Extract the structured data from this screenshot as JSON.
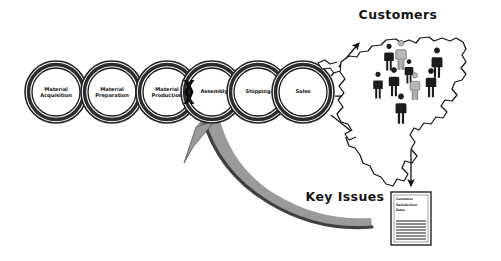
{
  "diagram": {
    "title_hidden": "",
    "type": "supply-chain-process-chain",
    "chain": {
      "rings": [
        {
          "id": "material-acquisition",
          "label": "Material\nAcquisition",
          "cx": 56,
          "cy": 92
        },
        {
          "id": "material-preparation",
          "label": "Material\nPreparation",
          "cx": 112,
          "cy": 92
        },
        {
          "id": "material-production",
          "label": "Material\nProduction",
          "cx": 167,
          "cy": 92
        },
        {
          "id": "assembly",
          "label": "Assembly",
          "cx": 212,
          "cy": 92
        },
        {
          "id": "shipping",
          "label": "Shipping",
          "cx": 258,
          "cy": 92
        },
        {
          "id": "sales",
          "label": "Sales",
          "cx": 303,
          "cy": 92
        }
      ],
      "break_marker": {
        "id": "chain-break-x",
        "x": 189,
        "y": 92,
        "meaning": "broken link between Material Production and Assembly"
      }
    },
    "labels": {
      "customers": "Customers",
      "key_issues": "Key Issues"
    },
    "document": {
      "lines": [
        "Customer",
        "Satisfaction",
        "Data"
      ],
      "rule_count": 7
    },
    "map": {
      "region": "North America",
      "figures": [
        {
          "x": 389,
          "y": 60,
          "h": 22,
          "tone": "dark"
        },
        {
          "x": 401,
          "y": 58,
          "h": 24,
          "tone": "light"
        },
        {
          "x": 409,
          "y": 74,
          "h": 20,
          "tone": "dark"
        },
        {
          "x": 437,
          "y": 66,
          "h": 25,
          "tone": "dark"
        },
        {
          "x": 378,
          "y": 88,
          "h": 22,
          "tone": "dark"
        },
        {
          "x": 394,
          "y": 85,
          "h": 24,
          "tone": "dark"
        },
        {
          "x": 415,
          "y": 89,
          "h": 22,
          "tone": "light"
        },
        {
          "x": 431,
          "y": 86,
          "h": 24,
          "tone": "dark"
        },
        {
          "x": 401,
          "y": 112,
          "h": 25,
          "tone": "dark"
        }
      ]
    },
    "colors": {
      "ink": "#111111",
      "ring_band": "#2b2b2b",
      "arrow_gray": "#9a9a9a",
      "arrow_gray_edge": "#3d3d3d",
      "figure_dark": "#1c1c1c",
      "figure_light": "#b8b8b8",
      "paper": "#ffffff"
    }
  }
}
